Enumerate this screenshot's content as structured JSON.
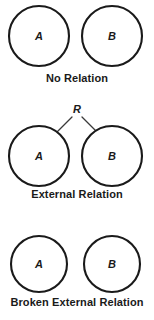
{
  "figure": {
    "width": 154,
    "height": 320,
    "background": "#ffffff",
    "stroke_color": "#1a1a1a",
    "line_color": "#3a3a3a"
  },
  "panels": [
    {
      "id": "no-relation",
      "caption": "No Relation",
      "nodes": [
        {
          "label": "A",
          "cx": 39,
          "cy": 36,
          "r": 30
        },
        {
          "label": "B",
          "cx": 112,
          "cy": 36,
          "r": 30
        }
      ],
      "relation": null,
      "has_connector": false
    },
    {
      "id": "external",
      "caption": "External Relation",
      "nodes": [
        {
          "label": "A",
          "cx": 39,
          "cy": 60,
          "r": 30
        },
        {
          "label": "B",
          "cx": 112,
          "cy": 60,
          "r": 30
        }
      ],
      "relation": {
        "label": "R",
        "apex_x": 77,
        "apex_y": 14
      },
      "has_connector": true
    },
    {
      "id": "broken",
      "caption": "Broken External Relation",
      "nodes": [
        {
          "label": "A",
          "cx": 39,
          "cy": 30,
          "r": 28
        },
        {
          "label": "B",
          "cx": 112,
          "cy": 30,
          "r": 28
        }
      ],
      "relation": null,
      "has_connector": false
    }
  ]
}
